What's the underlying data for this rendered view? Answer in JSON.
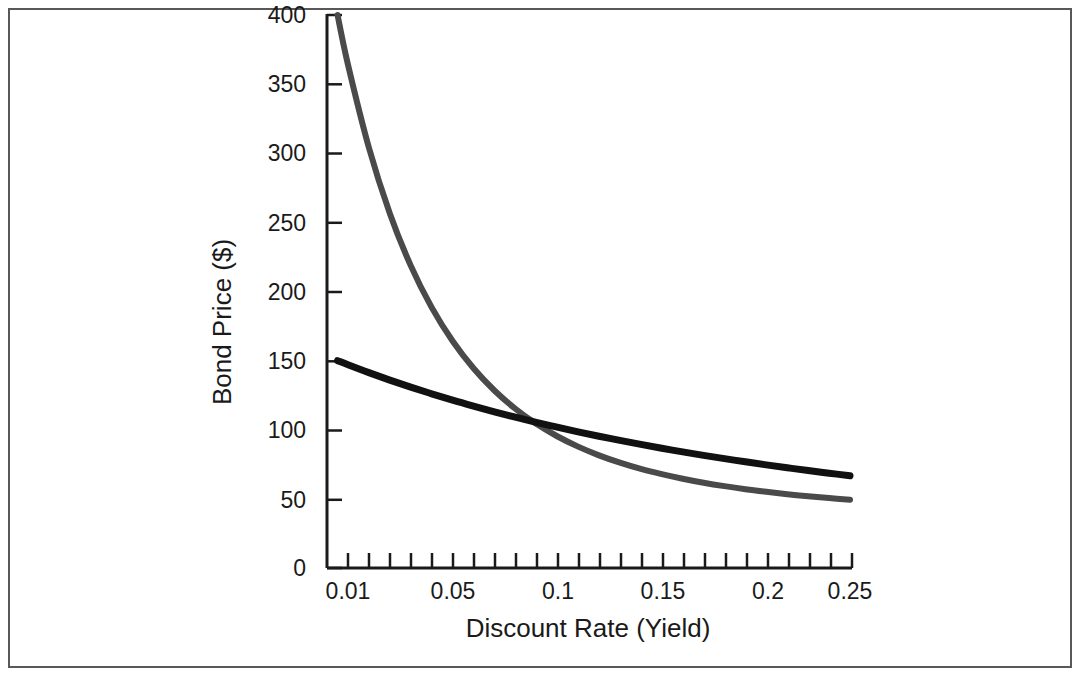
{
  "figure": {
    "background_color": "#ffffff",
    "frame_color": "#58585a",
    "has_border_frame": true,
    "has_title": false,
    "has_legend": false,
    "has_gridlines": false
  },
  "axes": {
    "x_title": "Discount Rate (Yield)",
    "y_title": "Bond Price ($)",
    "x_tick_labels": [
      "0.01",
      "0.05",
      "0.1",
      "0.15",
      "0.2",
      "0.25"
    ],
    "y_tick_labels": [
      "0",
      "50",
      "100",
      "150",
      "200",
      "250",
      "300",
      "350",
      "400"
    ],
    "tick_direction": "in",
    "x_minor_tick_count": 25
  },
  "colors": {
    "curve_short": "#111111",
    "curve_long": "#4a4a4a",
    "axis": "#1a1a1a",
    "text": "#1a1a1a"
  },
  "chart_data": {
    "type": "line",
    "title": "",
    "xlabel": "Discount Rate (Yield)",
    "ylabel": "Bond Price ($)",
    "xlim": [
      0.005,
      0.25
    ],
    "ylim": [
      0,
      400
    ],
    "xticks": [
      0.01,
      0.05,
      0.1,
      0.15,
      0.2,
      0.25
    ],
    "yticks": [
      0,
      50,
      100,
      150,
      200,
      250,
      300,
      350,
      400
    ],
    "grid": false,
    "legend": "none",
    "x": [
      0.005,
      0.01,
      0.02,
      0.03,
      0.04,
      0.05,
      0.06,
      0.07,
      0.08,
      0.09,
      0.1,
      0.11,
      0.12,
      0.13,
      0.14,
      0.15,
      0.16,
      0.17,
      0.18,
      0.19,
      0.2,
      0.21,
      0.22,
      0.23,
      0.24,
      0.25
    ],
    "series": [
      {
        "name": "Short maturity bond",
        "color": "#111111",
        "values": [
          150.0,
          147.0,
          141.3,
          135.9,
          130.8,
          126.0,
          121.4,
          117.1,
          113.0,
          109.1,
          105.4,
          101.9,
          98.5,
          95.3,
          92.3,
          89.4,
          86.6,
          84.0,
          81.5,
          79.1,
          76.8,
          74.6,
          72.5,
          70.5,
          68.6,
          66.7
        ]
      },
      {
        "name": "Long maturity bond",
        "color": "#4a4a4a",
        "values": [
          400.0,
          364.0,
          304.0,
          256.5,
          218.7,
          188.5,
          164.2,
          144.5,
          128.4,
          115.2,
          104.3,
          95.3,
          87.8,
          81.5,
          76.2,
          71.7,
          67.9,
          64.6,
          61.7,
          59.2,
          57.0,
          55.1,
          53.4,
          51.9,
          50.6,
          49.4
        ]
      }
    ],
    "annotations": [
      {
        "text": "curves intersect near yield 0.10 at price 100",
        "x": 0.1,
        "y": 100
      }
    ]
  }
}
